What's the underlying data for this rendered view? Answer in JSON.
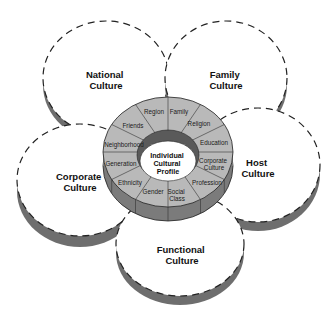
{
  "diagram": {
    "type": "cultural-influences",
    "center": {
      "label_lines": [
        "Individual",
        "Cultural",
        "Profile"
      ]
    },
    "ring_segments": [
      {
        "label_lines": [
          "Family"
        ]
      },
      {
        "label_lines": [
          "Religion"
        ]
      },
      {
        "label_lines": [
          "Education"
        ]
      },
      {
        "label_lines": [
          "Corporate",
          "Culture"
        ]
      },
      {
        "label_lines": [
          "Profession"
        ]
      },
      {
        "label_lines": [
          "Social",
          "Class"
        ]
      },
      {
        "label_lines": [
          "Gender"
        ]
      },
      {
        "label_lines": [
          "Ethnicity"
        ]
      },
      {
        "label_lines": [
          "Generation"
        ]
      },
      {
        "label_lines": [
          "Neighborhood"
        ]
      },
      {
        "label_lines": [
          "Friends"
        ]
      },
      {
        "label_lines": [
          "Region"
        ]
      }
    ],
    "outer_cultures": [
      {
        "id": "national",
        "label_lines": [
          "National",
          "Culture"
        ]
      },
      {
        "id": "family",
        "label_lines": [
          "Family",
          "Culture"
        ]
      },
      {
        "id": "host",
        "label_lines": [
          "Host",
          "Culture"
        ]
      },
      {
        "id": "corporate",
        "label_lines": [
          "Corporate",
          "Culture"
        ]
      },
      {
        "id": "functional",
        "label_lines": [
          "Functional",
          "Culture"
        ]
      }
    ],
    "colors": {
      "ring_top": "#b9b9b9",
      "ring_side": "#7b7b7b",
      "inner_rim": "#5a5a5a",
      "disk_shadow": "#6e6e6e",
      "stroke": "#222222",
      "background": "#ffffff"
    }
  }
}
